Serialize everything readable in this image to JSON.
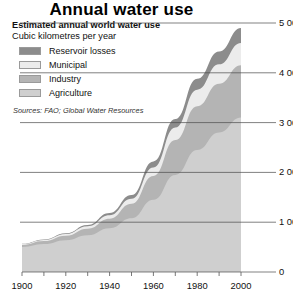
{
  "header": {
    "title": "Annual water use",
    "subtitle": "Estimated annual world water use",
    "units": "Cubic kilometres per year",
    "sources": "Sources: FAO; Global Water Resources"
  },
  "legend": {
    "items": [
      {
        "label": "Reservoir losses",
        "color": "#8c8c8c"
      },
      {
        "label": "Municipal",
        "color": "#ececec"
      },
      {
        "label": "Industry",
        "color": "#b4b4b4"
      },
      {
        "label": "Agriculture",
        "color": "#cfcfcf"
      }
    ]
  },
  "chart_data": {
    "type": "area",
    "stacked": true,
    "title": "Annual water use",
    "subtitle": "Estimated annual world water use",
    "xlabel": "",
    "ylabel": "Cubic kilometres per year",
    "xlim": [
      1900,
      2000
    ],
    "ylim": [
      0,
      5000
    ],
    "xticks": [
      1900,
      1910,
      1920,
      1930,
      1940,
      1950,
      1960,
      1970,
      1980,
      1990,
      2000
    ],
    "xtick_labels": [
      "1900",
      "",
      "1920",
      "",
      "1940",
      "",
      "1960",
      "",
      "1980",
      "",
      "2000"
    ],
    "yticks": [
      0,
      1000,
      2000,
      3000,
      4000,
      5000
    ],
    "ytick_labels": [
      "0",
      "1 000",
      "2 000",
      "3 000",
      "4 000",
      "5 000"
    ],
    "grid": true,
    "grid_axis": "y",
    "legend_position": "upper-left",
    "x": [
      1900,
      1910,
      1920,
      1930,
      1940,
      1950,
      1960,
      1970,
      1980,
      1990,
      2000
    ],
    "series": [
      {
        "name": "Agriculture",
        "color": "#cfcfcf",
        "values": [
          500,
          560,
          640,
          740,
          880,
          1080,
          1450,
          1950,
          2450,
          2800,
          3100
        ]
      },
      {
        "name": "Industry",
        "color": "#b4b4b4",
        "values": [
          40,
          60,
          90,
          130,
          190,
          290,
          480,
          700,
          880,
          980,
          1050
        ]
      },
      {
        "name": "Municipal",
        "color": "#ececec",
        "values": [
          20,
          25,
          35,
          50,
          70,
          100,
          170,
          250,
          330,
          390,
          450
        ]
      },
      {
        "name": "Reservoir losses",
        "color": "#8c8c8c",
        "values": [
          5,
          8,
          14,
          25,
          45,
          75,
          120,
          170,
          220,
          260,
          300
        ]
      }
    ],
    "totals": [
      565,
      653,
      779,
      945,
      1185,
      1545,
      2220,
      3070,
      3880,
      4430,
      4900
    ]
  }
}
